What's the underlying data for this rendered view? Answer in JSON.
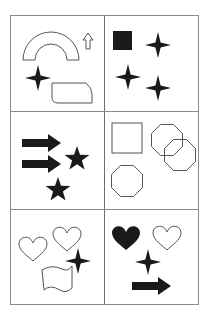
{
  "puzzle": {
    "layout": {
      "rows": 3,
      "cols": 2
    },
    "colors": {
      "fill": "#1a1a1a",
      "stroke": "#555555",
      "grid": "#8a8a8a"
    },
    "cells": [
      {
        "row": 0,
        "col": 0,
        "shapes": [
          "arch-outline",
          "up-arrow-outline",
          "four-point-star-filled",
          "rounded-tab-outline"
        ]
      },
      {
        "row": 0,
        "col": 1,
        "shapes": [
          "square-filled",
          "four-point-star-filled",
          "four-point-star-filled",
          "four-point-star-filled"
        ]
      },
      {
        "row": 1,
        "col": 0,
        "shapes": [
          "right-arrow-filled",
          "right-arrow-filled",
          "five-point-star-filled",
          "five-point-star-filled"
        ]
      },
      {
        "row": 1,
        "col": 1,
        "shapes": [
          "square-outline",
          "octagon-outline",
          "octagon-outline",
          "octagon-outline"
        ]
      },
      {
        "row": 2,
        "col": 0,
        "shapes": [
          "heart-outline",
          "heart-outline",
          "four-point-star-filled",
          "wave-flag-outline"
        ]
      },
      {
        "row": 2,
        "col": 1,
        "shapes": [
          "heart-filled",
          "heart-outline",
          "four-point-star-filled",
          "right-arrow-filled"
        ]
      }
    ]
  }
}
